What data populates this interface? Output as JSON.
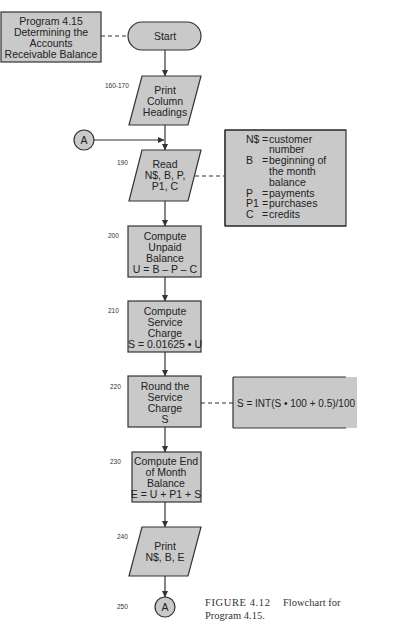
{
  "title_box": {
    "lines": [
      "Program 4.15",
      "Determining the",
      "Accounts",
      "Receivable Balance"
    ]
  },
  "nodes": {
    "start": {
      "label": "Start"
    },
    "print_headings": {
      "line_number": "160-170",
      "lines": [
        "Print",
        "Column",
        "Headings"
      ]
    },
    "connector_top": {
      "label": "A"
    },
    "read": {
      "line_number": "190",
      "lines": [
        "Read",
        "N$, B, P,",
        "P1, C"
      ]
    },
    "compute_unpaid": {
      "line_number": "200",
      "lines": [
        "Compute",
        "Unpaid",
        "Balance",
        "U = B – P – C"
      ]
    },
    "compute_service": {
      "line_number": "210",
      "lines": [
        "Compute",
        "Service",
        "Charge",
        "S = 0.01625 • U"
      ]
    },
    "round_service": {
      "line_number": "220",
      "lines": [
        "Round the",
        "Service",
        "Charge",
        "S"
      ]
    },
    "compute_end": {
      "line_number": "230",
      "lines": [
        "Compute End",
        "of Month",
        "Balance",
        "E = U + P1 + S"
      ]
    },
    "print_result": {
      "line_number": "240",
      "lines": [
        "Print",
        "N$, B, E"
      ]
    },
    "connector_bottom": {
      "line_number": "250",
      "label": "A"
    }
  },
  "variables_annotation": {
    "entries": [
      {
        "symbol": "N$",
        "meaning_lines": [
          "customer",
          "number"
        ]
      },
      {
        "symbol": "B",
        "meaning_lines": [
          "beginning of",
          "the month",
          "balance"
        ]
      },
      {
        "symbol": "P",
        "meaning_lines": [
          "payments"
        ]
      },
      {
        "symbol": "P1",
        "meaning_lines": [
          "purchases"
        ]
      },
      {
        "symbol": "C",
        "meaning_lines": [
          "credits"
        ]
      }
    ]
  },
  "rounding_annotation": {
    "formula": "S = INT(S •  100 + 0.5)/100"
  },
  "caption": {
    "figure_label": "FIGURE 4.12",
    "text_line1": "Flowchart for",
    "text_line2": "Program 4.15."
  },
  "colors": {
    "shape_fill": "#c9c9c9",
    "stroke": "#333333",
    "text": "#222222"
  }
}
